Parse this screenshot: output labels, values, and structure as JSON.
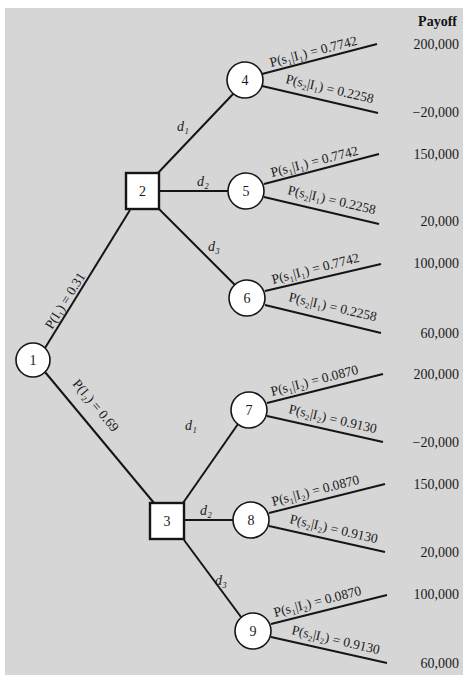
{
  "diagram": {
    "type": "decision-tree",
    "payoff_header": "Payoff",
    "root": {
      "id": "1",
      "shape": "circle"
    },
    "indicator_branches": [
      {
        "label": "P(I₁) = 0.31",
        "to": "2"
      },
      {
        "label": "P(I₂) = 0.69",
        "to": "3"
      }
    ],
    "decision_nodes": [
      {
        "id": "2",
        "shape": "square",
        "decisions": [
          {
            "label": "d₁",
            "to": "4"
          },
          {
            "label": "d₂",
            "to": "5"
          },
          {
            "label": "d₃",
            "to": "6"
          }
        ]
      },
      {
        "id": "3",
        "shape": "square",
        "decisions": [
          {
            "label": "d₁",
            "to": "7"
          },
          {
            "label": "d₂",
            "to": "8"
          },
          {
            "label": "d₃",
            "to": "9"
          }
        ]
      }
    ],
    "chance_nodes": [
      {
        "id": "4",
        "s1": "P(s₁|I₁) = 0.7742",
        "s2": "P(s₂|I₁) = 0.2258",
        "payoff_s1": "200,000",
        "payoff_s2": "−20,000"
      },
      {
        "id": "5",
        "s1": "P(s₁|I₁) = 0.7742",
        "s2": "P(s₂|I₁) = 0.2258",
        "payoff_s1": "150,000",
        "payoff_s2": "20,000"
      },
      {
        "id": "6",
        "s1": "P(s₁|I₁) = 0.7742",
        "s2": "P(s₂|I₁) = 0.2258",
        "payoff_s1": "100,000",
        "payoff_s2": "60,000"
      },
      {
        "id": "7",
        "s1": "P(s₁|I₂) = 0.0870",
        "s2": "P(s₂|I₂) = 0.9130",
        "payoff_s1": "200,000",
        "payoff_s2": "−20,000"
      },
      {
        "id": "8",
        "s1": "P(s₁|I₂) = 0.0870",
        "s2": "P(s₂|I₂) = 0.9130",
        "payoff_s1": "150,000",
        "payoff_s2": "20,000"
      },
      {
        "id": "9",
        "s1": "P(s₁|I₂) = 0.0870",
        "s2": "P(s₂|I₂) = 0.9130",
        "payoff_s1": "100,000",
        "payoff_s2": "60,000"
      }
    ]
  },
  "colors": {
    "background": "#d6d6d6",
    "frame": "#ffffff",
    "line": "#151515",
    "node_fill": "#ffffff"
  }
}
